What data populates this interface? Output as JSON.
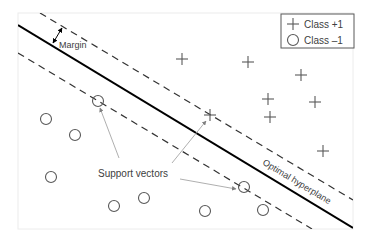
{
  "diagram": {
    "labels": {
      "margin": "Margin",
      "support_vectors": "Support vectors",
      "hyperplane": "Optimal hyperplane"
    },
    "legend": {
      "items": [
        {
          "symbol": "plus",
          "label": "Class +1"
        },
        {
          "symbol": "circle",
          "label": "Class –1"
        }
      ]
    },
    "colors": {
      "frame": "#e6e6e6",
      "hyperplane": "#000000",
      "margin_lines": "#333333",
      "points": "#595959",
      "arrows": "#a6a6a6",
      "text": "#404040"
    },
    "class_plus_points": [
      [
        182,
        59
      ],
      [
        248,
        62
      ],
      [
        301,
        75
      ],
      [
        268,
        99
      ],
      [
        315,
        102
      ],
      [
        270,
        117
      ],
      [
        210,
        115
      ],
      [
        323,
        151
      ]
    ],
    "class_minus_points": [
      [
        98,
        101
      ],
      [
        46,
        119
      ],
      [
        75,
        135
      ],
      [
        51,
        177
      ],
      [
        114,
        206
      ],
      [
        144,
        198
      ],
      [
        205,
        211
      ],
      [
        244,
        187
      ],
      [
        263,
        210
      ]
    ],
    "support_vectors": [
      [
        98,
        101
      ],
      [
        210,
        115
      ],
      [
        244,
        187
      ]
    ]
  }
}
